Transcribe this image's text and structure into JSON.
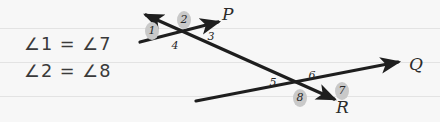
{
  "canvas": {
    "width": 440,
    "height": 122,
    "background": "#f7f7f7"
  },
  "ruled_lines": [
    {
      "y": 28
    },
    {
      "y": 62
    },
    {
      "y": 96
    }
  ],
  "equations": [
    {
      "id": "eq1",
      "text": "∠1 = ∠7",
      "x": 24,
      "y": 34
    },
    {
      "id": "eq2",
      "text": "∠2 = ∠8",
      "x": 24,
      "y": 61
    }
  ],
  "lines": [
    {
      "name": "P",
      "label": "P",
      "label_x": 222,
      "label_y": 4,
      "x1": 140,
      "y1": 42,
      "x2": 218,
      "y2": 22,
      "arrow_end": true,
      "arrow_start": false,
      "color": "#1e1e1e"
    },
    {
      "name": "Q",
      "label": "Q",
      "label_x": 409,
      "label_y": 54,
      "x1": 196,
      "y1": 101,
      "x2": 398,
      "y2": 62,
      "arrow_end": true,
      "arrow_start": false,
      "color": "#1e1e1e"
    },
    {
      "name": "R",
      "label": "R",
      "label_x": 336,
      "label_y": 97,
      "x1": 146,
      "y1": 15,
      "x2": 334,
      "y2": 99,
      "arrow_end": true,
      "arrow_start": true,
      "color": "#1e1e1e"
    }
  ],
  "angle_labels": [
    {
      "n": "1",
      "x": 145,
      "y": 24,
      "highlighted": true
    },
    {
      "n": "2",
      "x": 177,
      "y": 13,
      "highlighted": true
    },
    {
      "n": "3",
      "x": 204,
      "y": 30,
      "highlighted": false
    },
    {
      "n": "4",
      "x": 168,
      "y": 39,
      "highlighted": false
    },
    {
      "n": "5",
      "x": 266,
      "y": 76,
      "highlighted": false
    },
    {
      "n": "6",
      "x": 305,
      "y": 69,
      "highlighted": false
    },
    {
      "n": "7",
      "x": 335,
      "y": 84,
      "highlighted": true
    },
    {
      "n": "8",
      "x": 293,
      "y": 91,
      "highlighted": true
    }
  ],
  "colors": {
    "ink": "#1e1e1e",
    "text": "#3a3a3a",
    "highlight": "#c9c9c9",
    "rule": "#e3e3e3"
  }
}
